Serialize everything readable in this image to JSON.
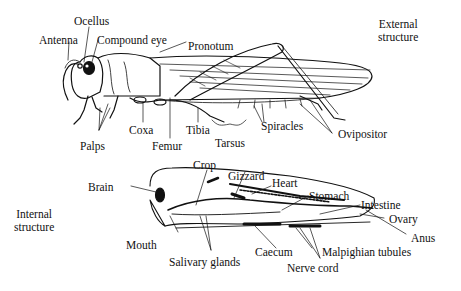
{
  "sections": {
    "external": {
      "line1": "External",
      "line2": "structure"
    },
    "internal": {
      "line1": "Internal",
      "line2": "structure"
    }
  },
  "external_labels": {
    "ocellus": "Ocellus",
    "antenna": "Antenna",
    "compound_eye": "Compound eye",
    "pronotum": "Pronotum",
    "palps": "Palps",
    "coxa": "Coxa",
    "femur": "Femur",
    "tibia": "Tibia",
    "tarsus": "Tarsus",
    "spiracles": "Spiracles",
    "ovipositor": "Ovipositor"
  },
  "internal_labels": {
    "brain": "Brain",
    "crop": "Crop",
    "gizzard": "Gizzard",
    "heart": "Heart",
    "stomach": "Stomach",
    "intestine": "Intestine",
    "ovary": "Ovary",
    "anus": "Anus",
    "mouth": "Mouth",
    "salivary_glands": "Salivary glands",
    "caecum": "Caecum",
    "malpighian_tubules": "Malpighian tubules",
    "nerve_cord": "Nerve cord"
  }
}
